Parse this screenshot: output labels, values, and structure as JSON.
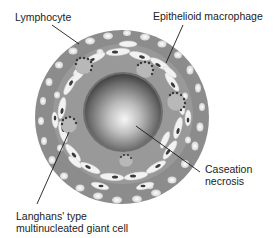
{
  "figure": {
    "labels": {
      "lymphocyte": "Lymphocyte",
      "epithelioid_macrophage": "Epithelioid macrophage",
      "caseation_line1": "Caseation",
      "caseation_line2": "necrosis",
      "langhans_line1": "Langhans' type",
      "langhans_line2": "multinucleated giant cell"
    },
    "colors": {
      "outer_ring": "#8c8c8c",
      "cell_white": "#f2f2f2",
      "nucleus": "#3a3a3a",
      "giant_cell": "#b8b8b8",
      "core_light": "#f4f4f4",
      "core_dark": "#2e2e2e",
      "leader_line": "#1a1a1a",
      "text": "#222222"
    }
  }
}
